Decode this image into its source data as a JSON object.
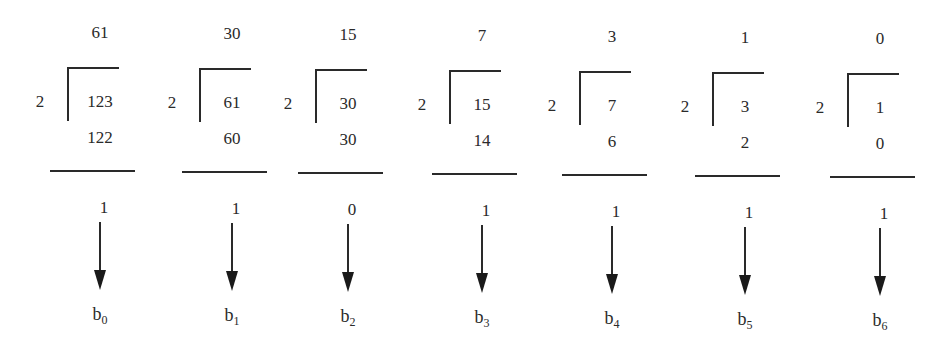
{
  "diagram": {
    "title": "",
    "divisor": "2",
    "steps": [
      {
        "quotient": "61",
        "dividend": "123",
        "product": "122",
        "remainder": "1",
        "bit_label": "b",
        "bit_index": "0"
      },
      {
        "quotient": "30",
        "dividend": "61",
        "product": "60",
        "remainder": "1",
        "bit_label": "b",
        "bit_index": "1"
      },
      {
        "quotient": "15",
        "dividend": "30",
        "product": "30",
        "remainder": "0",
        "bit_label": "b",
        "bit_index": "2"
      },
      {
        "quotient": "7",
        "dividend": "15",
        "product": "14",
        "remainder": "1",
        "bit_label": "b",
        "bit_index": "3"
      },
      {
        "quotient": "3",
        "dividend": "7",
        "product": "6",
        "remainder": "1",
        "bit_label": "b",
        "bit_index": "4"
      },
      {
        "quotient": "1",
        "dividend": "3",
        "product": "2",
        "remainder": "1",
        "bit_label": "b",
        "bit_index": "5"
      },
      {
        "quotient": "0",
        "dividend": "1",
        "product": "0",
        "remainder": "1",
        "bit_label": "b",
        "bit_index": "6"
      }
    ]
  }
}
